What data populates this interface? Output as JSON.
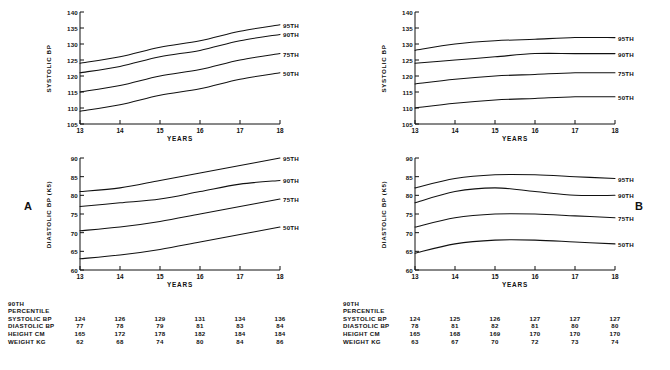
{
  "figure": {
    "panels": [
      {
        "letter": "A",
        "charts": [
          {
            "name": "systolic",
            "ylabel": "SYSTOLIC BP",
            "xlabel": "YEARS",
            "yticks": [
              105,
              110,
              115,
              120,
              125,
              130,
              135,
              140
            ],
            "xticks": [
              13,
              14,
              15,
              16,
              17,
              18
            ],
            "curves": [
              {
                "label": "95TH",
                "values": [
                  124,
                  126,
                  129,
                  131,
                  134,
                  136
                ]
              },
              {
                "label": "90TH",
                "values": [
                  121,
                  123,
                  126,
                  128,
                  131,
                  133
                ]
              },
              {
                "label": "75TH",
                "values": [
                  115,
                  117,
                  120,
                  122,
                  125,
                  127
                ]
              },
              {
                "label": "50TH",
                "values": [
                  109,
                  111,
                  114,
                  116,
                  119,
                  121
                ]
              }
            ]
          },
          {
            "name": "diastolic",
            "ylabel": "DIASTOLIC BP (K5)",
            "xlabel": "YEARS",
            "yticks": [
              60,
              65,
              70,
              75,
              80,
              85,
              90
            ],
            "xticks": [
              13,
              14,
              15,
              16,
              17,
              18
            ],
            "curves": [
              {
                "label": "95TH",
                "values": [
                  81,
                  82,
                  84,
                  86,
                  88,
                  90
                ]
              },
              {
                "label": "90TH",
                "values": [
                  77,
                  78,
                  79,
                  81,
                  83,
                  84
                ]
              },
              {
                "label": "75TH",
                "values": [
                  70.5,
                  71.5,
                  73,
                  75,
                  77,
                  79
                ]
              },
              {
                "label": "50TH",
                "values": [
                  63,
                  64,
                  65.5,
                  67.5,
                  69.5,
                  71.5
                ]
              }
            ]
          }
        ],
        "table": {
          "head": [
            "90TH",
            "PERCENTILE"
          ],
          "columns": [
            13,
            14,
            15,
            16,
            17,
            18
          ],
          "rows": [
            {
              "label": "SYSTOLIC BP",
              "values": [
                124,
                126,
                129,
                131,
                134,
                136
              ]
            },
            {
              "label": "DIASTOLIC BP",
              "values": [
                77,
                78,
                79,
                81,
                83,
                84
              ]
            },
            {
              "label": "HEIGHT CM",
              "values": [
                165,
                172,
                178,
                182,
                184,
                184
              ]
            },
            {
              "label": "WEIGHT KG",
              "values": [
                62,
                68,
                74,
                80,
                84,
                86
              ]
            }
          ]
        }
      },
      {
        "letter": "B",
        "charts": [
          {
            "name": "systolic",
            "ylabel": "SYSTOLIC BP",
            "xlabel": "YEARS",
            "yticks": [
              105,
              110,
              115,
              120,
              125,
              130,
              135,
              140
            ],
            "xticks": [
              13,
              14,
              15,
              16,
              17,
              18
            ],
            "curves": [
              {
                "label": "95TH",
                "values": [
                  128,
                  130,
                  131,
                  131.5,
                  132,
                  132
                ]
              },
              {
                "label": "90TH",
                "values": [
                  124,
                  125,
                  126,
                  127,
                  127,
                  127
                ]
              },
              {
                "label": "75TH",
                "values": [
                  117.5,
                  119,
                  120,
                  120.5,
                  121,
                  121
                ]
              },
              {
                "label": "50TH",
                "values": [
                  110,
                  111.5,
                  112.5,
                  113,
                  113.5,
                  113.5
                ]
              }
            ]
          },
          {
            "name": "diastolic",
            "ylabel": "DIASTOLIC BP (K5)",
            "xlabel": "YEARS",
            "yticks": [
              60,
              65,
              70,
              75,
              80,
              85,
              90
            ],
            "xticks": [
              13,
              14,
              15,
              16,
              17,
              18
            ],
            "curves": [
              {
                "label": "95TH",
                "values": [
                  82,
                  84.5,
                  85.5,
                  85.5,
                  85,
                  84.5
                ]
              },
              {
                "label": "90TH",
                "values": [
                  78,
                  81,
                  82,
                  81,
                  80,
                  80
                ]
              },
              {
                "label": "75TH",
                "values": [
                  71.5,
                  74,
                  75,
                  75,
                  74.5,
                  74
                ]
              },
              {
                "label": "50TH",
                "values": [
                  64.5,
                  67,
                  68,
                  68,
                  67.5,
                  67
                ]
              }
            ]
          }
        ],
        "table": {
          "head": [
            "90TH",
            "PERCENTILE"
          ],
          "columns": [
            13,
            14,
            15,
            16,
            17,
            18
          ],
          "rows": [
            {
              "label": "SYSTOLIC BP",
              "values": [
                124,
                125,
                126,
                127,
                127,
                127
              ]
            },
            {
              "label": "DIASTOLIC BP",
              "values": [
                78,
                81,
                82,
                81,
                80,
                80
              ]
            },
            {
              "label": "HEIGHT CM",
              "values": [
                165,
                168,
                169,
                170,
                170,
                170
              ]
            },
            {
              "label": "WEIGHT KG",
              "values": [
                63,
                67,
                70,
                72,
                73,
                74
              ]
            }
          ]
        }
      }
    ]
  },
  "chart_data": {
    "type": "line",
    "xlabel": "YEARS",
    "x": [
      13,
      14,
      15,
      16,
      17,
      18
    ],
    "panels": [
      {
        "panel": "A",
        "subplots": [
          {
            "name": "Panel A — Systolic BP",
            "ylabel": "SYSTOLIC BP",
            "ylim": [
              105,
              140
            ],
            "yticks": [
              105,
              110,
              115,
              120,
              125,
              130,
              135,
              140
            ],
            "grid": false,
            "legend_position": "right-inline",
            "series": [
              {
                "name": "95TH",
                "values": [
                  124,
                  126,
                  129,
                  131,
                  134,
                  136
                ]
              },
              {
                "name": "90TH",
                "values": [
                  121,
                  123,
                  126,
                  128,
                  131,
                  133
                ]
              },
              {
                "name": "75TH",
                "values": [
                  115,
                  117,
                  120,
                  122,
                  125,
                  127
                ]
              },
              {
                "name": "50TH",
                "values": [
                  109,
                  111,
                  114,
                  116,
                  119,
                  121
                ]
              }
            ]
          },
          {
            "name": "Panel A — Diastolic BP",
            "ylabel": "DIASTOLIC BP (K5)",
            "ylim": [
              60,
              90
            ],
            "yticks": [
              60,
              65,
              70,
              75,
              80,
              85,
              90
            ],
            "grid": false,
            "legend_position": "right-inline",
            "series": [
              {
                "name": "95TH",
                "values": [
                  81,
                  82,
                  84,
                  86,
                  88,
                  90
                ]
              },
              {
                "name": "90TH",
                "values": [
                  77,
                  78,
                  79,
                  81,
                  83,
                  84
                ]
              },
              {
                "name": "75TH",
                "values": [
                  70.5,
                  71.5,
                  73,
                  75,
                  77,
                  79
                ]
              },
              {
                "name": "50TH",
                "values": [
                  63,
                  64,
                  65.5,
                  67.5,
                  69.5,
                  71.5
                ]
              }
            ]
          }
        ],
        "table": {
          "type": "table",
          "title": "90TH PERCENTILE",
          "columns": [
            13,
            14,
            15,
            16,
            17,
            18
          ],
          "rows": [
            {
              "label": "SYSTOLIC BP",
              "values": [
                124,
                126,
                129,
                131,
                134,
                136
              ]
            },
            {
              "label": "DIASTOLIC BP",
              "values": [
                77,
                78,
                79,
                81,
                83,
                84
              ]
            },
            {
              "label": "HEIGHT CM",
              "values": [
                165,
                172,
                178,
                182,
                184,
                184
              ]
            },
            {
              "label": "WEIGHT KG",
              "values": [
                62,
                68,
                74,
                80,
                84,
                86
              ]
            }
          ]
        }
      },
      {
        "panel": "B",
        "subplots": [
          {
            "name": "Panel B — Systolic BP",
            "ylabel": "SYSTOLIC BP",
            "ylim": [
              105,
              140
            ],
            "yticks": [
              105,
              110,
              115,
              120,
              125,
              130,
              135,
              140
            ],
            "grid": false,
            "legend_position": "right-inline",
            "series": [
              {
                "name": "95TH",
                "values": [
                  128,
                  130,
                  131,
                  131.5,
                  132,
                  132
                ]
              },
              {
                "name": "90TH",
                "values": [
                  124,
                  125,
                  126,
                  127,
                  127,
                  127
                ]
              },
              {
                "name": "75TH",
                "values": [
                  117.5,
                  119,
                  120,
                  120.5,
                  121,
                  121
                ]
              },
              {
                "name": "50TH",
                "values": [
                  110,
                  111.5,
                  112.5,
                  113,
                  113.5,
                  113.5
                ]
              }
            ]
          },
          {
            "name": "Panel B — Diastolic BP",
            "ylabel": "DIASTOLIC BP (K5)",
            "ylim": [
              60,
              90
            ],
            "yticks": [
              60,
              65,
              70,
              75,
              80,
              85,
              90
            ],
            "grid": false,
            "legend_position": "right-inline",
            "series": [
              {
                "name": "95TH",
                "values": [
                  82,
                  84.5,
                  85.5,
                  85.5,
                  85,
                  84.5
                ]
              },
              {
                "name": "90TH",
                "values": [
                  78,
                  81,
                  82,
                  81,
                  80,
                  80
                ]
              },
              {
                "name": "75TH",
                "values": [
                  71.5,
                  74,
                  75,
                  75,
                  74.5,
                  74
                ]
              },
              {
                "name": "50TH",
                "values": [
                  64.5,
                  67,
                  68,
                  68,
                  67.5,
                  67
                ]
              }
            ]
          }
        ],
        "table": {
          "type": "table",
          "title": "90TH PERCENTILE",
          "columns": [
            13,
            14,
            15,
            16,
            17,
            18
          ],
          "rows": [
            {
              "label": "SYSTOLIC BP",
              "values": [
                124,
                125,
                126,
                127,
                127,
                127
              ]
            },
            {
              "label": "DIASTOLIC BP",
              "values": [
                78,
                81,
                82,
                81,
                80,
                80
              ]
            },
            {
              "label": "HEIGHT CM",
              "values": [
                165,
                168,
                169,
                170,
                170,
                170
              ]
            },
            {
              "label": "WEIGHT KG",
              "values": [
                63,
                67,
                70,
                72,
                73,
                74
              ]
            }
          ]
        }
      }
    ]
  }
}
